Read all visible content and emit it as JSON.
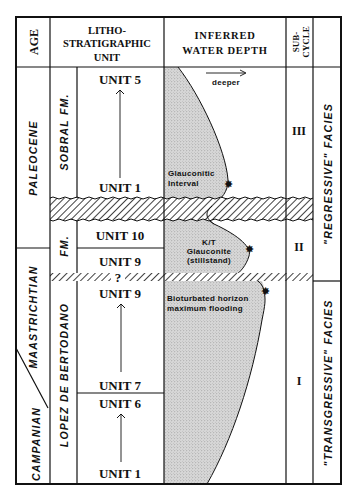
{
  "headers": {
    "age": "AGE",
    "litho_line1": "LITHO-",
    "litho_line2": "STRATIGRAPHIC",
    "litho_line3": "UNIT",
    "depth_line1": "INFERRED",
    "depth_line2": "WATER DEPTH",
    "subcycle_line1": "SUB-",
    "subcycle_line2": "CYCLE"
  },
  "ages": {
    "paleocene": "PALEOCENE",
    "maastrichtian": "MAASTRICHTIAN",
    "campanian": "CAMPANIAN"
  },
  "formations": {
    "sobral": "SOBRAL FM.",
    "lopez_fm": "FM.",
    "lopez": "LOPEZ DE BERTODANO"
  },
  "units": {
    "sobral_top": "UNIT 5",
    "sobral_base": "UNIT 1",
    "lb_unit10": "UNIT 10",
    "lb_unit9_upper": "UNIT 9",
    "uncertain_marker": "?",
    "lb_unit9_lower": "UNIT 9",
    "lb_unit7": "UNIT 7",
    "lb_unit6": "UNIT 6",
    "lb_unit1": "UNIT 1"
  },
  "water_depth": {
    "direction_label": "deeper",
    "glauconitic_line1": "Glauconitic",
    "glauconitic_line2": "Interval",
    "kt_line1": "K/T",
    "kt_line2": "Glauconite",
    "kt_line3": "(stillstand)",
    "bioturbated_line1": "Bioturbated horizon",
    "bioturbated_line2": "maximum flooding"
  },
  "subcycles": {
    "upper": "III",
    "middle": "II",
    "lower": "I"
  },
  "facies": {
    "regressive": "\"REGRESSIVE\" FACIES",
    "transgressive": "\"TRANSGRESSIVE\" FACIES"
  },
  "colors": {
    "line": "#111111",
    "stipple": "#c9c9c9",
    "background": "#ffffff"
  }
}
